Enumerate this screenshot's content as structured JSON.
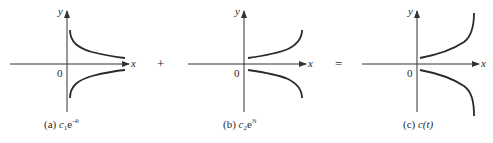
{
  "panels": [
    {
      "id": "a",
      "caption_prefix": "(a)",
      "caption_coef": "c",
      "caption_sub": "1",
      "caption_base": "e",
      "caption_exp": "-4t",
      "axis_x_label": "x",
      "axis_y_label": "y",
      "origin_label": "0",
      "curve_shape": "decaying (upper positive, lower negative mirror)"
    },
    {
      "id": "b",
      "caption_prefix": "(b)",
      "caption_coef": "c",
      "caption_sub": "2",
      "caption_base": "e",
      "caption_exp": "3t",
      "axis_x_label": "x",
      "axis_y_label": "y",
      "origin_label": "0",
      "curve_shape": "growing (upper positive, lower negative mirror)"
    },
    {
      "id": "c",
      "caption_prefix": "(c)",
      "caption_fn": "c(t)",
      "axis_x_label": "x",
      "axis_y_label": "y",
      "origin_label": "0",
      "curve_shape": "sum - growing (upper positive, lower negative mirror)"
    }
  ],
  "operators": {
    "plus": "+",
    "equals": "="
  },
  "colors": {
    "ink": "#2a2a2a",
    "axis": "#333333",
    "background": "#ffffff"
  }
}
